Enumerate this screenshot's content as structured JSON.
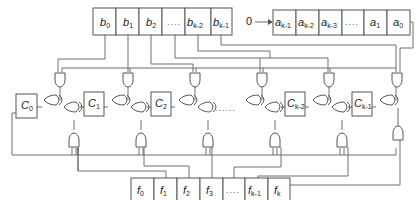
{
  "diagram": {
    "type": "shift-register multiplier circuit",
    "b_register": {
      "cells": [
        {
          "base": "b",
          "sub": "0"
        },
        {
          "base": "b",
          "sub": "1"
        },
        {
          "base": "b",
          "sub": "2"
        },
        {
          "base": "",
          "sub": "",
          "dots": "...."
        },
        {
          "base": "b",
          "sub": "k-2"
        },
        {
          "base": "b",
          "sub": "k-1"
        }
      ]
    },
    "a_register": {
      "input_label": "0",
      "cells": [
        {
          "base": "a",
          "sub": "k-1"
        },
        {
          "base": "a",
          "sub": "k-2"
        },
        {
          "base": "a",
          "sub": "k-3"
        },
        {
          "base": "",
          "sub": "",
          "dots": "...."
        },
        {
          "base": "a",
          "sub": "1"
        },
        {
          "base": "a",
          "sub": "0"
        }
      ]
    },
    "c_registers": [
      {
        "base": "C",
        "sub": "0"
      },
      {
        "base": "C",
        "sub": "1"
      },
      {
        "base": "C",
        "sub": "2"
      },
      {
        "base": "C",
        "sub": "k-2"
      },
      {
        "base": "C",
        "sub": "k-1"
      }
    ],
    "middle_dots": "......",
    "f_register": {
      "cells": [
        {
          "base": "f",
          "sub": "0"
        },
        {
          "base": "f",
          "sub": "1"
        },
        {
          "base": "f",
          "sub": "2"
        },
        {
          "base": "f",
          "sub": "3"
        },
        {
          "base": "",
          "sub": "",
          "dots": "...."
        },
        {
          "base": "f",
          "sub": "k-1"
        },
        {
          "base": "f",
          "sub": "k"
        }
      ]
    },
    "gates": {
      "and_top_count": 6,
      "and_bottom_count": 6,
      "xor_count": 10
    }
  }
}
